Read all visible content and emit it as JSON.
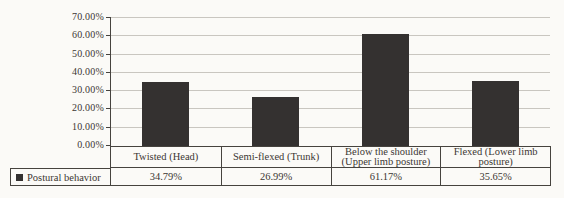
{
  "chart_data": {
    "type": "bar",
    "title": "",
    "categories": [
      "Twisted (Head)",
      "Semi-flexed (Trunk)",
      "Below the shoulder (Upper limb posture)",
      "Flexed (Lower limb posture)"
    ],
    "series": [
      {
        "name": "Postural behavior",
        "values": [
          34.79,
          26.99,
          61.17,
          35.65
        ]
      }
    ],
    "value_labels": [
      "34.79%",
      "26.99%",
      "61.17%",
      "35.65%"
    ],
    "y_tick_labels": [
      "70.00%",
      "60.00%",
      "50.00%",
      "40.00%",
      "30.00%",
      "20.00%",
      "10.00%",
      "0.00%"
    ],
    "y_tick_values": [
      70,
      60,
      50,
      40,
      30,
      20,
      10,
      0
    ],
    "ylim": [
      0,
      70
    ],
    "grid": true,
    "legend_position": "bottom-left-table",
    "data_table_shown": true
  },
  "colors": {
    "background": "#fbfaf7",
    "text": "#3b3733",
    "grid": "#c9c6c0",
    "border": "#46433e",
    "bar": "#343130"
  }
}
